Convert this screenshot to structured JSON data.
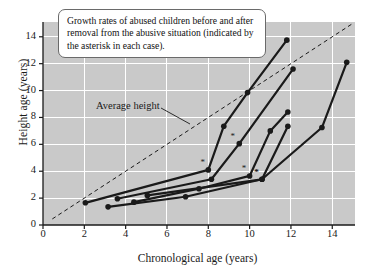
{
  "caption": {
    "text": "Growth rates of abused children before and after removal from the abusive situation (indicated by the asterisk in each case)."
  },
  "annotations": {
    "average_height_label": "Average height"
  },
  "chart_data": {
    "type": "line",
    "title": "",
    "subtitle": "",
    "xlabel": "Chronological age (years)",
    "ylabel": "Height age (years)",
    "xlim": [
      0,
      15.1
    ],
    "ylim": [
      0,
      15.1
    ],
    "xticks": [
      0,
      2,
      4,
      6,
      8,
      10,
      12,
      14
    ],
    "yticks": [
      0,
      2,
      4,
      6,
      8,
      10,
      12,
      14
    ],
    "xtick_labels": [
      "0",
      "2",
      "4",
      "6",
      "8",
      "10",
      "12",
      "14"
    ],
    "ytick_labels": [
      "0",
      "2",
      "4",
      "6",
      "8",
      "10",
      "12",
      "14"
    ],
    "grid": true,
    "grid_color": "#ffffff",
    "plot_background": "#c9c9c9",
    "legend": "none",
    "series_color": "#1a1a1a",
    "reference_line": {
      "name": "Average height",
      "style": "dashed",
      "x": [
        0.45,
        15.0
      ],
      "y": [
        0.45,
        15.0
      ],
      "label": "Average height"
    },
    "series": [
      {
        "name": "case-1",
        "removal_marker_x": 8.0,
        "removal_marker_y": 4.1,
        "x": [
          2.05,
          8.0,
          8.75,
          9.9,
          11.8
        ],
        "y": [
          1.65,
          4.1,
          7.35,
          9.85,
          13.75
        ]
      },
      {
        "name": "case-2",
        "removal_marker_x": 9.45,
        "removal_marker_y": 6.05,
        "x": [
          3.6,
          8.15,
          9.5,
          12.1
        ],
        "y": [
          1.95,
          3.4,
          6.05,
          11.6
        ]
      },
      {
        "name": "case-3",
        "removal_marker_x": 10.0,
        "removal_marker_y": 3.65,
        "x": [
          4.4,
          7.55,
          10.0,
          11.0,
          11.85
        ],
        "y": [
          1.7,
          2.7,
          3.65,
          7.0,
          8.4
        ]
      },
      {
        "name": "case-4",
        "removal_marker_x": 10.6,
        "removal_marker_y": 3.4,
        "x": [
          3.15,
          6.9,
          10.6,
          11.85
        ],
        "y": [
          1.35,
          2.1,
          3.4,
          7.35
        ]
      },
      {
        "name": "case-5",
        "removal_marker_x": 10.6,
        "removal_marker_y": 3.4,
        "x": [
          5.05,
          10.6,
          13.5,
          14.7
        ],
        "y": [
          2.2,
          3.4,
          7.25,
          12.1
        ]
      }
    ]
  }
}
